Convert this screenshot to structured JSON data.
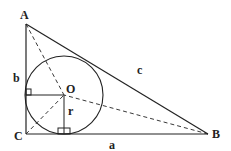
{
  "diagram": {
    "points": {
      "A": {
        "label": "A",
        "x": 26,
        "y": 24
      },
      "B": {
        "label": "B",
        "x": 208,
        "y": 134
      },
      "C": {
        "label": "C",
        "x": 26,
        "y": 134
      },
      "O": {
        "label": "O",
        "x": 64,
        "y": 95
      }
    },
    "sides": {
      "a": {
        "label": "a"
      },
      "b": {
        "label": "b"
      },
      "c": {
        "label": "c"
      }
    },
    "radius": {
      "label": "r",
      "value_px": 39
    },
    "colors": {
      "stroke": "#222222",
      "background": "#ffffff"
    }
  }
}
